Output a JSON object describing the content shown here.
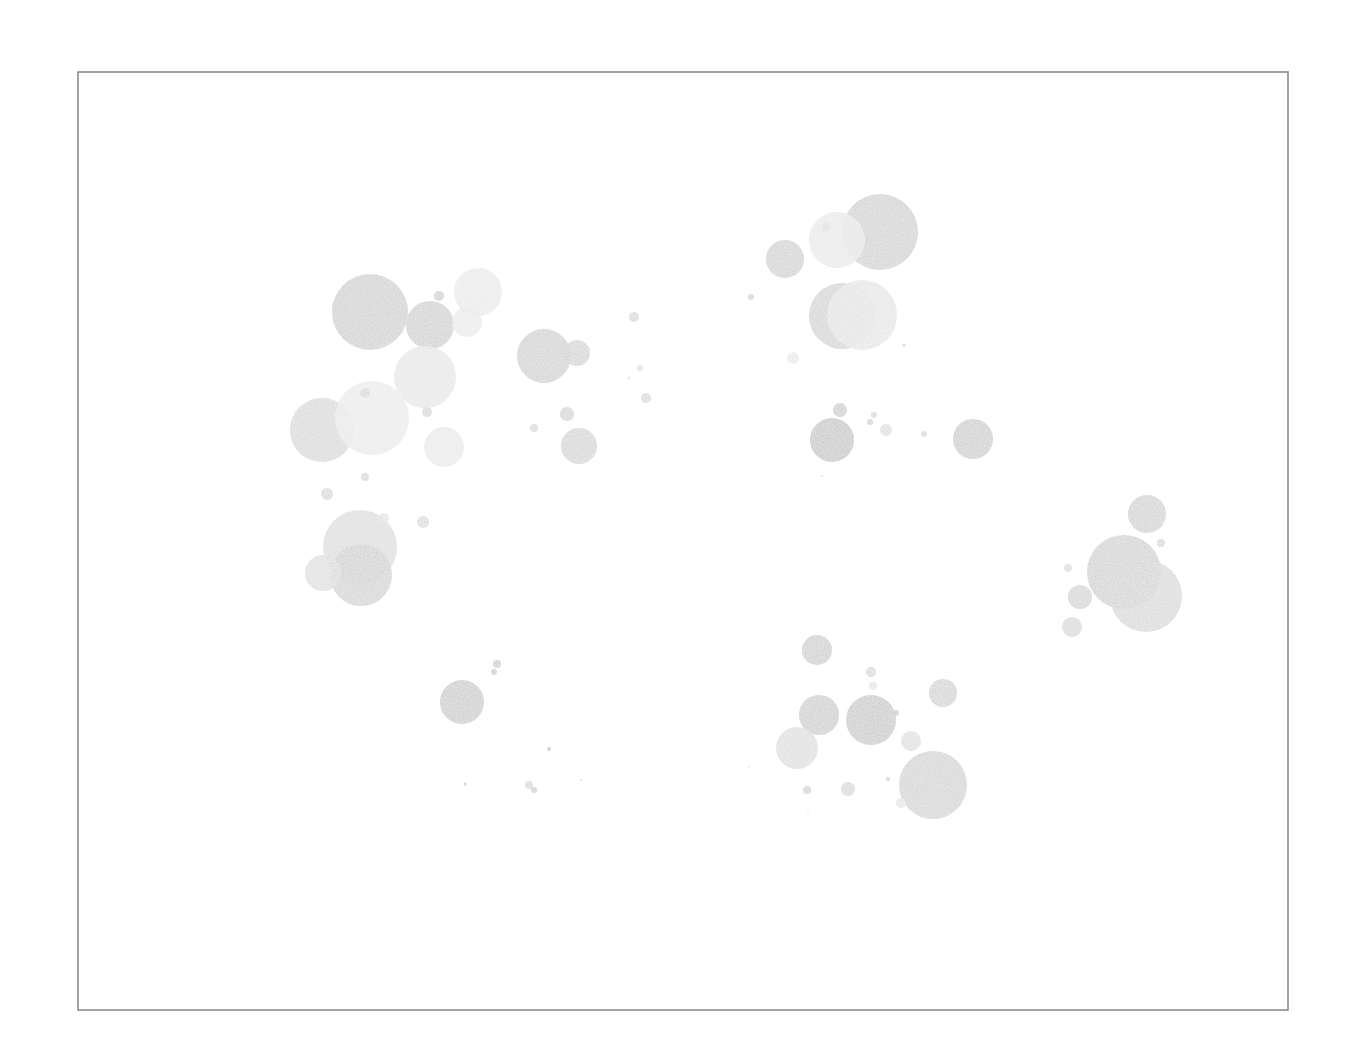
{
  "chart_data": {
    "type": "scatter",
    "subtype": "bubble",
    "title": "",
    "xlabel": "",
    "ylabel": "",
    "grid": false,
    "legend": null,
    "axes_visible": false,
    "frame": {
      "x": 78,
      "y": 72,
      "width": 1210,
      "height": 938,
      "stroke": "#8c8c8c"
    },
    "coordinate_space": "pixel",
    "points": [
      {
        "x": 370,
        "y": 312,
        "r": 38,
        "shade": "#c4c4c4",
        "opacity": 0.8
      },
      {
        "x": 430,
        "y": 325,
        "r": 24,
        "shade": "#c4c4c4",
        "opacity": 0.8
      },
      {
        "x": 478,
        "y": 292,
        "r": 24,
        "shade": "#e6e6e6",
        "opacity": 0.85
      },
      {
        "x": 467,
        "y": 322,
        "r": 15,
        "shade": "#e6e6e6",
        "opacity": 0.8
      },
      {
        "x": 439,
        "y": 296,
        "r": 5,
        "shade": "#c4c4c4",
        "opacity": 0.8
      },
      {
        "x": 425,
        "y": 377,
        "r": 31,
        "shade": "#e3e3e3",
        "opacity": 0.85
      },
      {
        "x": 322,
        "y": 430,
        "r": 32,
        "shade": "#cfcfcf",
        "opacity": 0.8
      },
      {
        "x": 372,
        "y": 418,
        "r": 37,
        "shade": "#e8e8e8",
        "opacity": 0.88
      },
      {
        "x": 365,
        "y": 393,
        "r": 5,
        "shade": "#d0d0d0",
        "opacity": 0.8
      },
      {
        "x": 427,
        "y": 412,
        "r": 5,
        "shade": "#d0d0d0",
        "opacity": 0.8
      },
      {
        "x": 444,
        "y": 447,
        "r": 20,
        "shade": "#e6e6e6",
        "opacity": 0.85
      },
      {
        "x": 365,
        "y": 477,
        "r": 4,
        "shade": "#d0d0d0",
        "opacity": 0.8
      },
      {
        "x": 327,
        "y": 494,
        "r": 6,
        "shade": "#cfcfcf",
        "opacity": 0.8
      },
      {
        "x": 360,
        "y": 547,
        "r": 37,
        "shade": "#d4d4d4",
        "opacity": 0.8
      },
      {
        "x": 361,
        "y": 575,
        "r": 31,
        "shade": "#c8c8c8",
        "opacity": 0.8
      },
      {
        "x": 323,
        "y": 573,
        "r": 18,
        "shade": "#d8d8d8",
        "opacity": 0.8
      },
      {
        "x": 384,
        "y": 518,
        "r": 5,
        "shade": "#e0e0e0",
        "opacity": 0.8
      },
      {
        "x": 423,
        "y": 522,
        "r": 6,
        "shade": "#d4d4d4",
        "opacity": 0.8
      },
      {
        "x": 544,
        "y": 356,
        "r": 27,
        "shade": "#c6c6c6",
        "opacity": 0.8
      },
      {
        "x": 577,
        "y": 353,
        "r": 13,
        "shade": "#cbcbcb",
        "opacity": 0.8
      },
      {
        "x": 567,
        "y": 414,
        "r": 7,
        "shade": "#cbcbcb",
        "opacity": 0.8
      },
      {
        "x": 534,
        "y": 428,
        "r": 4,
        "shade": "#d0d0d0",
        "opacity": 0.8
      },
      {
        "x": 579,
        "y": 446,
        "r": 18,
        "shade": "#cbcbcb",
        "opacity": 0.8
      },
      {
        "x": 634,
        "y": 317,
        "r": 5,
        "shade": "#cfcfcf",
        "opacity": 0.8
      },
      {
        "x": 640,
        "y": 368,
        "r": 3,
        "shade": "#d8d8d8",
        "opacity": 0.8
      },
      {
        "x": 629,
        "y": 378,
        "r": 1.5,
        "shade": "#d8d8d8",
        "opacity": 0.8
      },
      {
        "x": 646,
        "y": 398,
        "r": 5,
        "shade": "#cfcfcf",
        "opacity": 0.8
      },
      {
        "x": 751,
        "y": 297,
        "r": 3,
        "shade": "#c8c8c8",
        "opacity": 0.8
      },
      {
        "x": 785,
        "y": 259,
        "r": 19,
        "shade": "#c6c6c6",
        "opacity": 0.8
      },
      {
        "x": 880,
        "y": 232,
        "r": 38,
        "shade": "#c6c6c6",
        "opacity": 0.8
      },
      {
        "x": 837,
        "y": 240,
        "r": 28,
        "shade": "#e6e6e6",
        "opacity": 0.88
      },
      {
        "x": 826,
        "y": 227,
        "r": 4,
        "shade": "#d8d8d8",
        "opacity": 0.8
      },
      {
        "x": 842,
        "y": 316,
        "r": 33,
        "shade": "#c8c8c8",
        "opacity": 0.8
      },
      {
        "x": 862,
        "y": 315,
        "r": 35,
        "shade": "#e2e2e2",
        "opacity": 0.88
      },
      {
        "x": 793,
        "y": 358,
        "r": 6,
        "shade": "#e6e6e6",
        "opacity": 0.8
      },
      {
        "x": 904,
        "y": 345,
        "r": 1.5,
        "shade": "#c8c8c8",
        "opacity": 0.8
      },
      {
        "x": 832,
        "y": 440,
        "r": 22,
        "shade": "#b8b8b8",
        "opacity": 0.8
      },
      {
        "x": 840,
        "y": 410,
        "r": 7,
        "shade": "#c0c0c0",
        "opacity": 0.8
      },
      {
        "x": 874,
        "y": 415,
        "r": 3,
        "shade": "#cfcfcf",
        "opacity": 0.8
      },
      {
        "x": 870,
        "y": 422,
        "r": 3,
        "shade": "#c8c8c8",
        "opacity": 0.8
      },
      {
        "x": 886,
        "y": 430,
        "r": 6,
        "shade": "#d8d8d8",
        "opacity": 0.8
      },
      {
        "x": 924,
        "y": 434,
        "r": 3,
        "shade": "#d0d0d0",
        "opacity": 0.8
      },
      {
        "x": 973,
        "y": 439,
        "r": 20,
        "shade": "#c0c0c0",
        "opacity": 0.8
      },
      {
        "x": 822,
        "y": 476,
        "r": 1,
        "shade": "#d8d8d8",
        "opacity": 0.8
      },
      {
        "x": 1147,
        "y": 514,
        "r": 19,
        "shade": "#c6c6c6",
        "opacity": 0.8
      },
      {
        "x": 1161,
        "y": 543,
        "r": 4,
        "shade": "#d0d0d0",
        "opacity": 0.8
      },
      {
        "x": 1124,
        "y": 572,
        "r": 37,
        "shade": "#c6c6c6",
        "opacity": 0.8
      },
      {
        "x": 1146,
        "y": 596,
        "r": 36,
        "shade": "#cfcfcf",
        "opacity": 0.8
      },
      {
        "x": 1068,
        "y": 568,
        "r": 4,
        "shade": "#d8d8d8",
        "opacity": 0.8
      },
      {
        "x": 1080,
        "y": 597,
        "r": 12,
        "shade": "#cbcbcb",
        "opacity": 0.8
      },
      {
        "x": 1072,
        "y": 627,
        "r": 10,
        "shade": "#cfcfcf",
        "opacity": 0.8
      },
      {
        "x": 817,
        "y": 650,
        "r": 15,
        "shade": "#c2c2c2",
        "opacity": 0.8
      },
      {
        "x": 871,
        "y": 672,
        "r": 5,
        "shade": "#cfcfcf",
        "opacity": 0.8
      },
      {
        "x": 873,
        "y": 686,
        "r": 4,
        "shade": "#e0e0e0",
        "opacity": 0.8
      },
      {
        "x": 943,
        "y": 693,
        "r": 14,
        "shade": "#c8c8c8",
        "opacity": 0.8
      },
      {
        "x": 819,
        "y": 715,
        "r": 20,
        "shade": "#c0c0c0",
        "opacity": 0.8
      },
      {
        "x": 871,
        "y": 720,
        "r": 25,
        "shade": "#bcbcbc",
        "opacity": 0.8
      },
      {
        "x": 896,
        "y": 713,
        "r": 3,
        "shade": "#c0c0c0",
        "opacity": 0.8
      },
      {
        "x": 797,
        "y": 748,
        "r": 21,
        "shade": "#d8d8d8",
        "opacity": 0.85
      },
      {
        "x": 911,
        "y": 741,
        "r": 10,
        "shade": "#d8d8d8",
        "opacity": 0.8
      },
      {
        "x": 933,
        "y": 785,
        "r": 34,
        "shade": "#c8c8c8",
        "opacity": 0.8
      },
      {
        "x": 888,
        "y": 779,
        "r": 2,
        "shade": "#c0c0c0",
        "opacity": 0.8
      },
      {
        "x": 807,
        "y": 790,
        "r": 4,
        "shade": "#c8c8c8",
        "opacity": 0.8
      },
      {
        "x": 848,
        "y": 789,
        "r": 7,
        "shade": "#d0d0d0",
        "opacity": 0.8
      },
      {
        "x": 901,
        "y": 803,
        "r": 5,
        "shade": "#e0e0e0",
        "opacity": 0.8
      },
      {
        "x": 808,
        "y": 813,
        "r": 1,
        "shade": "#e0e0e0",
        "opacity": 0.8
      },
      {
        "x": 749,
        "y": 767,
        "r": 1,
        "shade": "#e0e0e0",
        "opacity": 0.8
      },
      {
        "x": 462,
        "y": 702,
        "r": 22,
        "shade": "#bebebe",
        "opacity": 0.8
      },
      {
        "x": 497,
        "y": 664,
        "r": 4,
        "shade": "#c0c0c0",
        "opacity": 0.8
      },
      {
        "x": 494,
        "y": 672,
        "r": 3,
        "shade": "#c0c0c0",
        "opacity": 0.8
      },
      {
        "x": 549,
        "y": 749,
        "r": 2,
        "shade": "#b8b8b8",
        "opacity": 0.8
      },
      {
        "x": 465,
        "y": 784,
        "r": 1.5,
        "shade": "#b8b8b8",
        "opacity": 0.8
      },
      {
        "x": 529,
        "y": 785,
        "r": 4,
        "shade": "#cfcfcf",
        "opacity": 0.8
      },
      {
        "x": 534,
        "y": 790,
        "r": 3,
        "shade": "#c0c0c0",
        "opacity": 0.8
      },
      {
        "x": 581,
        "y": 780,
        "r": 1,
        "shade": "#d8d8d8",
        "opacity": 0.8
      }
    ]
  }
}
